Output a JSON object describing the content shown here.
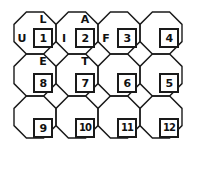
{
  "puzzle": {
    "title": "Octagonal Tiling Number Grid",
    "grid": {
      "columns": 4,
      "rows": 3,
      "tile_shape": "octagon",
      "pitch_x": 42,
      "pitch_y": 42,
      "origin_x": 14,
      "origin_y": 12,
      "line_color": "#1a1a1a",
      "background_color": "#ffffff"
    },
    "cells": [
      {
        "number": "1",
        "col": 0,
        "row": 0,
        "x": 33,
        "y": 28
      },
      {
        "number": "2",
        "col": 1,
        "row": 0,
        "x": 75,
        "y": 28
      },
      {
        "number": "3",
        "col": 2,
        "row": 0,
        "x": 117,
        "y": 28
      },
      {
        "number": "4",
        "col": 3,
        "row": 0,
        "x": 159,
        "y": 28
      },
      {
        "number": "8",
        "col": 0,
        "row": 1,
        "x": 33,
        "y": 73
      },
      {
        "number": "7",
        "col": 1,
        "row": 1,
        "x": 75,
        "y": 73
      },
      {
        "number": "6",
        "col": 2,
        "row": 1,
        "x": 117,
        "y": 73
      },
      {
        "number": "5",
        "col": 3,
        "row": 1,
        "x": 159,
        "y": 73
      },
      {
        "number": "9",
        "col": 0,
        "row": 2,
        "x": 33,
        "y": 118
      },
      {
        "number": "10",
        "col": 1,
        "row": 2,
        "x": 75,
        "y": 118
      },
      {
        "number": "11",
        "col": 2,
        "row": 2,
        "x": 117,
        "y": 118
      },
      {
        "number": "12",
        "col": 3,
        "row": 2,
        "x": 159,
        "y": 118
      }
    ],
    "letters": [
      {
        "char": "L",
        "x": 35,
        "y": 11,
        "position": "above-cell-1"
      },
      {
        "char": "A",
        "x": 77,
        "y": 11,
        "position": "above-cell-2"
      },
      {
        "char": "U",
        "x": 14,
        "y": 30,
        "position": "left-of-cell-1"
      },
      {
        "char": "I",
        "x": 56,
        "y": 30,
        "position": "right-of-cell-1"
      },
      {
        "char": "F",
        "x": 98,
        "y": 30,
        "position": "right-of-cell-2"
      },
      {
        "char": "E",
        "x": 35,
        "y": 53,
        "position": "below-cell-1"
      },
      {
        "char": "T",
        "x": 77,
        "y": 53,
        "position": "below-cell-2"
      }
    ],
    "sequence_order": [
      "1",
      "2",
      "3",
      "4",
      "5",
      "6",
      "7",
      "8",
      "9",
      "10",
      "11",
      "12"
    ],
    "word_letters": "ULIAFET"
  }
}
